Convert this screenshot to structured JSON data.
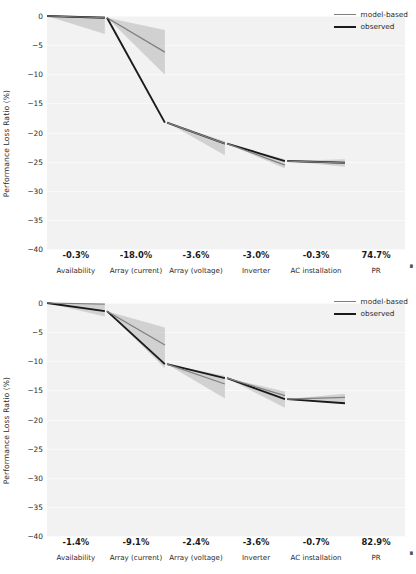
{
  "figure": {
    "background": "#ffffff",
    "panel_background": "#f2f2f2",
    "axis_label": "Performance Loss Ratio (%)"
  },
  "legend": {
    "position": "upper-right",
    "entries": [
      {
        "label": "model-based",
        "color": "#7f7f7f",
        "width": 1.3
      },
      {
        "label": "observed",
        "color": "#1a1a1a",
        "width": 2.1
      }
    ]
  },
  "axis": {
    "yticks": [
      0,
      -5,
      -10,
      -15,
      -20,
      -25,
      -30,
      -35,
      -40
    ],
    "ytick_labels": [
      "0",
      "−5",
      "−10",
      "−15",
      "−20",
      "−25",
      "−30",
      "−35",
      "−40"
    ],
    "ylim": [
      -40,
      0
    ],
    "categories": [
      "Availability",
      "Array (current)",
      "Array (voltage)",
      "Inverter",
      "AC installation",
      "PR"
    ],
    "edge_glyph": "▪"
  },
  "chart_data": [
    {
      "type": "area",
      "title": "Top waterfall — PR 74.7%",
      "subtitle": "",
      "xlabel": "",
      "ylabel": "Performance Loss Ratio (%)",
      "ylim": [
        -40,
        0
      ],
      "grid": true,
      "legend_position": "upper right",
      "categories": [
        "Availability",
        "Array (current)",
        "Array (voltage)",
        "Inverter",
        "AC installation",
        "PR"
      ],
      "step_labels": [
        "-0.3%",
        "-18.0%",
        "-3.6%",
        "-3.0%",
        "-0.3%",
        "74.7%"
      ],
      "step_values": [
        -0.3,
        -18.0,
        -3.6,
        -3.0,
        -0.3,
        74.7
      ],
      "series": [
        {
          "name": "observed",
          "color": "#1a1a1a",
          "cumulative_start": [
            0.0,
            -0.3,
            -18.3,
            -21.9,
            -24.9
          ],
          "cumulative_end": [
            -0.3,
            -18.3,
            -21.9,
            -24.9,
            -25.2
          ]
        },
        {
          "name": "model-based",
          "color": "#7f7f7f",
          "cumulative_start": [
            0.0,
            -0.3,
            -18.3,
            -21.9,
            -24.9
          ],
          "cumulative_end": [
            -0.3,
            -6.2,
            -21.9,
            -25.6,
            -25.2
          ]
        }
      ],
      "uncertainty_bands": [
        {
          "segment": "Availability",
          "start_lo": 0.0,
          "start_hi": 0.0,
          "end_lo": -3.1,
          "end_hi": 0.0
        },
        {
          "segment": "Array (current)",
          "start_lo": -0.3,
          "start_hi": -0.3,
          "end_lo": -10.1,
          "end_hi": -2.4
        },
        {
          "segment": "Array (voltage)",
          "start_lo": -18.3,
          "start_hi": -18.3,
          "end_lo": -23.9,
          "end_hi": -21.5
        },
        {
          "segment": "Inverter",
          "start_lo": -21.9,
          "start_hi": -21.9,
          "end_lo": -26.2,
          "end_hi": -24.6
        },
        {
          "segment": "AC installation",
          "start_lo": -24.9,
          "start_hi": -24.9,
          "end_lo": -25.9,
          "end_hi": -24.6
        }
      ]
    },
    {
      "type": "area",
      "title": "Bottom waterfall — PR 82.9%",
      "subtitle": "",
      "xlabel": "",
      "ylabel": "Performance Loss Ratio (%)",
      "ylim": [
        -40,
        0
      ],
      "grid": true,
      "legend_position": "upper right",
      "categories": [
        "Availability",
        "Array (current)",
        "Array (voltage)",
        "Inverter",
        "AC installation",
        "PR"
      ],
      "step_labels": [
        "-1.4%",
        "-9.1%",
        "-2.4%",
        "-3.6%",
        "-0.7%",
        "82.9%"
      ],
      "step_values": [
        -1.4,
        -9.1,
        -2.4,
        -3.6,
        -0.7,
        82.9
      ],
      "series": [
        {
          "name": "observed",
          "color": "#1a1a1a",
          "cumulative_start": [
            0.0,
            -1.4,
            -10.5,
            -12.9,
            -16.5
          ],
          "cumulative_end": [
            -1.4,
            -10.5,
            -12.9,
            -16.5,
            -17.2
          ]
        },
        {
          "name": "model-based",
          "color": "#7f7f7f",
          "cumulative_start": [
            0.0,
            -1.4,
            -10.5,
            -12.9,
            -16.5
          ],
          "cumulative_end": [
            -0.2,
            -7.2,
            -13.9,
            -15.9,
            -16.2
          ]
        }
      ],
      "uncertainty_bands": [
        {
          "segment": "Availability",
          "start_lo": 0.0,
          "start_hi": 0.0,
          "end_lo": -2.3,
          "end_hi": -0.2
        },
        {
          "segment": "Array (current)",
          "start_lo": -1.4,
          "start_hi": -1.4,
          "end_lo": -11.2,
          "end_hi": -4.2
        },
        {
          "segment": "Array (voltage)",
          "start_lo": -10.5,
          "start_hi": -10.5,
          "end_lo": -16.4,
          "end_hi": -12.5
        },
        {
          "segment": "Inverter",
          "start_lo": -12.9,
          "start_hi": -12.9,
          "end_lo": -18.0,
          "end_hi": -15.2
        },
        {
          "segment": "AC installation",
          "start_lo": -16.5,
          "start_hi": -16.5,
          "end_lo": -17.3,
          "end_hi": -15.6
        }
      ]
    }
  ]
}
